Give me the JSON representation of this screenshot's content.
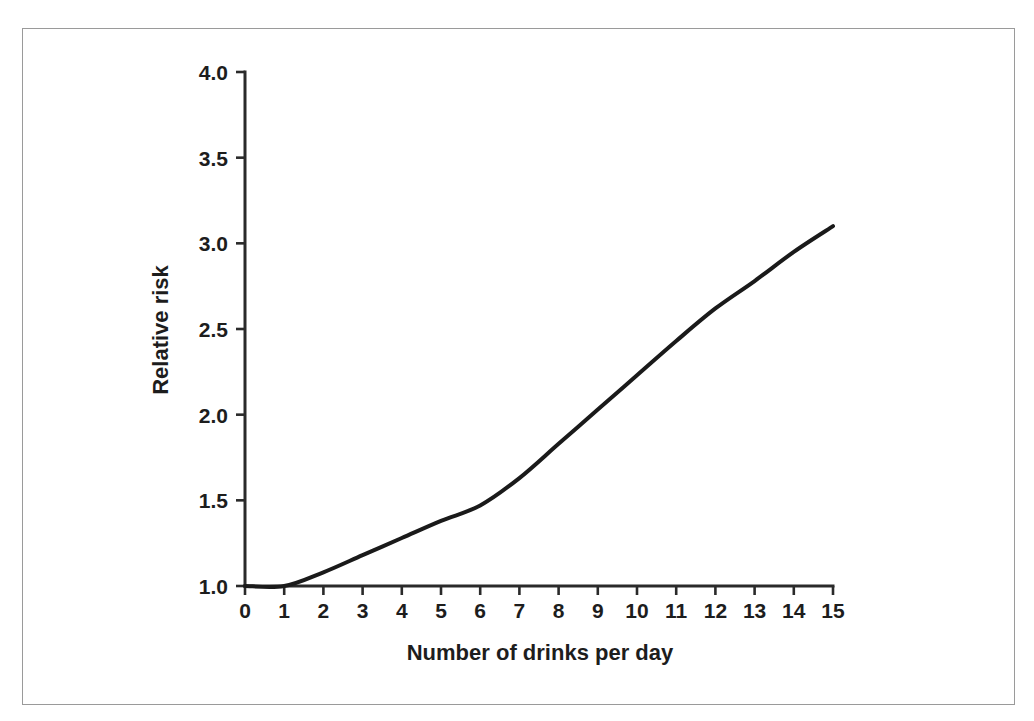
{
  "chart_data": {
    "type": "line",
    "title": "",
    "subtitle": "",
    "xlabel": "Number of drinks per day",
    "ylabel": "Relative risk",
    "x": [
      0,
      1,
      2,
      3,
      4,
      5,
      6,
      7,
      8,
      9,
      10,
      11,
      12,
      13,
      14,
      15
    ],
    "values": [
      1.0,
      1.0,
      1.08,
      1.18,
      1.28,
      1.38,
      1.47,
      1.63,
      1.83,
      2.03,
      2.23,
      2.43,
      2.62,
      2.78,
      2.95,
      3.1
    ],
    "series": [
      {
        "name": "Relative risk",
        "values": [
          1.0,
          1.0,
          1.08,
          1.18,
          1.28,
          1.38,
          1.47,
          1.63,
          1.83,
          2.03,
          2.23,
          2.43,
          2.62,
          2.78,
          2.95,
          3.1
        ],
        "color": "#1a1a1a"
      }
    ],
    "xlim": [
      0,
      15
    ],
    "ylim": [
      1.0,
      4.0
    ],
    "xticks": [
      0,
      1,
      2,
      3,
      4,
      5,
      6,
      7,
      8,
      9,
      10,
      11,
      12,
      13,
      14,
      15
    ],
    "xtick_labels": [
      "0",
      "1",
      "2",
      "3",
      "4",
      "5",
      "6",
      "7",
      "8",
      "9",
      "10",
      "11",
      "12",
      "13",
      "14",
      "15"
    ],
    "yticks": [
      1.0,
      1.5,
      2.0,
      2.5,
      3.0,
      3.5,
      4.0
    ],
    "ytick_labels": [
      "1.0",
      "1.5",
      "2.0",
      "2.5",
      "3.0",
      "3.5",
      "4.0"
    ],
    "grid": false,
    "legend": false,
    "legend_position": "none",
    "annotations": [],
    "frame_color": "#9a9a9a",
    "axis_color": "#2a2a2a",
    "background": "#ffffff"
  }
}
